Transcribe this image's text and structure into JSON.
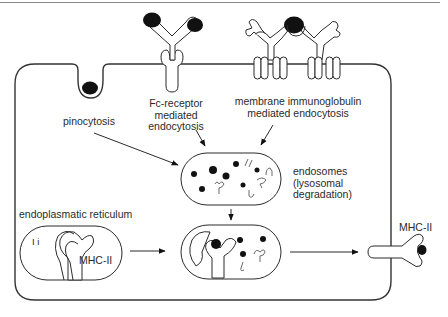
{
  "diagram": {
    "labels": {
      "pinocytosis": "pinocytosis",
      "fc_receptor_line1": "Fc-receptor",
      "fc_receptor_line2": "mediated",
      "fc_receptor_line3": "endocytosis",
      "membrane_ig_line1": "membrane immunoglobulin",
      "membrane_ig_line2": "mediated endocytosis",
      "endosomes_line1": "endosomes",
      "endosomes_line2": "(lysosomal",
      "endosomes_line3": "degradation)",
      "er": "endoplasmatic reticulum",
      "ii": "I i",
      "mhc_ii_er": "MHC-II",
      "mhc_ii_surface": "MHC-II"
    },
    "nodes": [
      {
        "id": "pinocytosis",
        "label": "pinocytosis"
      },
      {
        "id": "fc_receptor",
        "label": "Fc-receptor mediated endocytosis"
      },
      {
        "id": "membrane_ig",
        "label": "membrane immunoglobulin mediated endocytosis"
      },
      {
        "id": "endosome",
        "label": "endosomes (lysosomal degradation)"
      },
      {
        "id": "er",
        "label": "endoplasmatic reticulum"
      },
      {
        "id": "fusion",
        "label": "MHC-II loading compartment"
      },
      {
        "id": "surface",
        "label": "MHC-II"
      }
    ],
    "edges": [
      {
        "from": "pinocytosis",
        "to": "endosome"
      },
      {
        "from": "fc_receptor",
        "to": "endosome"
      },
      {
        "from": "membrane_ig",
        "to": "endosome"
      },
      {
        "from": "endosome",
        "to": "fusion"
      },
      {
        "from": "er",
        "to": "fusion"
      },
      {
        "from": "fusion",
        "to": "surface"
      }
    ],
    "colors": {
      "line": "#2b2b2b",
      "antigen": "#111111",
      "background": "#ffffff"
    }
  }
}
